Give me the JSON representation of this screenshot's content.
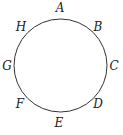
{
  "diagram": {
    "shape": "circle",
    "center": [
      60.5,
      65.5
    ],
    "radius": 46.5,
    "stroke_color": "#333333",
    "points": [
      {
        "label": "A",
        "x": 60,
        "y": 12
      },
      {
        "label": "B",
        "x": 98,
        "y": 27
      },
      {
        "label": "C",
        "x": 114,
        "y": 69
      },
      {
        "label": "D",
        "x": 98,
        "y": 107
      },
      {
        "label": "E",
        "x": 59,
        "y": 126
      },
      {
        "label": "F",
        "x": 20,
        "y": 107
      },
      {
        "label": "G",
        "x": 6,
        "y": 69
      },
      {
        "label": "H",
        "x": 21,
        "y": 30
      }
    ]
  }
}
